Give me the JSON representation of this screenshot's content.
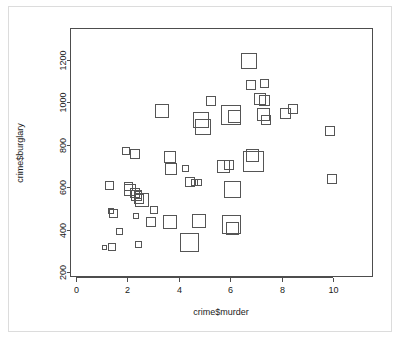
{
  "chart_data": {
    "type": "scatter",
    "title": "",
    "xlabel": "crime$murder",
    "ylabel": "crime$burglary",
    "xlim": [
      -0.35,
      11.2
    ],
    "ylim": [
      155,
      1290
    ],
    "xticks": [
      0,
      2,
      4,
      6,
      8,
      10
    ],
    "xticklabels": [
      "0",
      "2",
      "4",
      "6",
      "8",
      "10"
    ],
    "yticks": [
      200,
      400,
      600,
      800,
      1000,
      1200
    ],
    "yticklabels": [
      "200",
      "400",
      "600",
      "800",
      "1000",
      "1200"
    ],
    "grid": false,
    "legend": null,
    "symbol": "open-square",
    "size_encodes": "third variable (symbol side length varies per point)",
    "points": [
      {
        "x": 1.1,
        "y": 317,
        "size": 4
      },
      {
        "x": 1.4,
        "y": 319,
        "size": 7
      },
      {
        "x": 1.3,
        "y": 607,
        "size": 8
      },
      {
        "x": 1.35,
        "y": 487,
        "size": 5
      },
      {
        "x": 1.45,
        "y": 478,
        "size": 8
      },
      {
        "x": 1.7,
        "y": 389,
        "size": 6
      },
      {
        "x": 1.95,
        "y": 769,
        "size": 7
      },
      {
        "x": 2.05,
        "y": 605,
        "size": 8
      },
      {
        "x": 2.1,
        "y": 586,
        "size": 11
      },
      {
        "x": 2.3,
        "y": 757,
        "size": 9
      },
      {
        "x": 2.3,
        "y": 571,
        "size": 9
      },
      {
        "x": 2.35,
        "y": 560,
        "size": 10
      },
      {
        "x": 2.4,
        "y": 563,
        "size": 7
      },
      {
        "x": 2.45,
        "y": 545,
        "size": 9
      },
      {
        "x": 2.55,
        "y": 541,
        "size": 13
      },
      {
        "x": 2.45,
        "y": 329,
        "size": 6
      },
      {
        "x": 2.35,
        "y": 463,
        "size": 5
      },
      {
        "x": 2.9,
        "y": 437,
        "size": 9
      },
      {
        "x": 3.05,
        "y": 492,
        "size": 7
      },
      {
        "x": 3.35,
        "y": 957,
        "size": 13
      },
      {
        "x": 3.65,
        "y": 742,
        "size": 11
      },
      {
        "x": 3.7,
        "y": 687,
        "size": 11
      },
      {
        "x": 3.65,
        "y": 438,
        "size": 13
      },
      {
        "x": 4.25,
        "y": 688,
        "size": 6
      },
      {
        "x": 4.45,
        "y": 623,
        "size": 9
      },
      {
        "x": 4.6,
        "y": 622,
        "size": 6
      },
      {
        "x": 4.75,
        "y": 620,
        "size": 6
      },
      {
        "x": 4.4,
        "y": 337,
        "size": 18
      },
      {
        "x": 4.8,
        "y": 439,
        "size": 13
      },
      {
        "x": 4.85,
        "y": 915,
        "size": 15
      },
      {
        "x": 4.95,
        "y": 882,
        "size": 15
      },
      {
        "x": 5.25,
        "y": 1004,
        "size": 9
      },
      {
        "x": 5.75,
        "y": 697,
        "size": 12
      },
      {
        "x": 5.95,
        "y": 706,
        "size": 9
      },
      {
        "x": 6.05,
        "y": 941,
        "size": 19
      },
      {
        "x": 6.15,
        "y": 931,
        "size": 12
      },
      {
        "x": 6.1,
        "y": 588,
        "size": 16
      },
      {
        "x": 6.05,
        "y": 423,
        "size": 18
      },
      {
        "x": 6.1,
        "y": 406,
        "size": 12
      },
      {
        "x": 6.75,
        "y": 1196,
        "size": 15
      },
      {
        "x": 6.8,
        "y": 1079,
        "size": 9
      },
      {
        "x": 6.9,
        "y": 723,
        "size": 20
      },
      {
        "x": 6.85,
        "y": 748,
        "size": 12
      },
      {
        "x": 7.35,
        "y": 1089,
        "size": 8
      },
      {
        "x": 7.15,
        "y": 1017,
        "size": 11
      },
      {
        "x": 7.35,
        "y": 1008,
        "size": 10
      },
      {
        "x": 7.3,
        "y": 944,
        "size": 12
      },
      {
        "x": 7.4,
        "y": 916,
        "size": 9
      },
      {
        "x": 8.15,
        "y": 948,
        "size": 10
      },
      {
        "x": 8.45,
        "y": 966,
        "size": 9
      },
      {
        "x": 9.9,
        "y": 866,
        "size": 9
      },
      {
        "x": 9.95,
        "y": 639,
        "size": 9
      }
    ]
  },
  "plot_geometry": {
    "frame": {
      "left": 70,
      "top": 28,
      "right": 373,
      "bottom": 277
    },
    "x_pixel_per_unit": 25.7,
    "x_origin_px": 76,
    "y_pixel_per_unit": 0.2122,
    "y_base_value": 200,
    "y_base_px": 272
  }
}
